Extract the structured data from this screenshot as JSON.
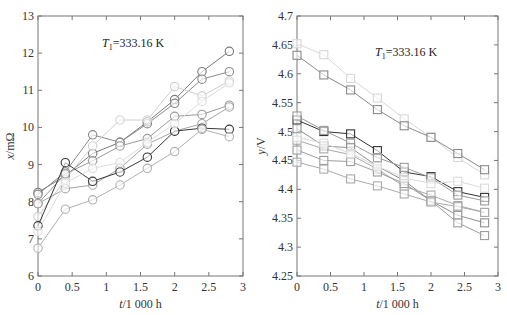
{
  "chart_data": [
    {
      "type": "line",
      "marker": "circle",
      "annotation": "T1=333.16 K",
      "annotation_main": "T",
      "annotation_sub": "1",
      "annotation_rest": "=333.16 K",
      "xlabel": "t/1 000 h",
      "ylabel": "x/mΩ",
      "xlim": [
        0,
        3
      ],
      "ylim": [
        6,
        13
      ],
      "xticks": [
        "0",
        "0.5",
        "1",
        "1.5",
        "2",
        "2.5",
        "3"
      ],
      "yticks": [
        "6",
        "7",
        "8",
        "9",
        "10",
        "11",
        "12",
        "13"
      ],
      "x": [
        0,
        0.4,
        0.8,
        1.2,
        1.6,
        2.0,
        2.4,
        2.8
      ],
      "series": [
        {
          "name": "s1",
          "color": "#7a7a7a",
          "values": [
            8.25,
            8.7,
            9.3,
            9.6,
            10.15,
            10.75,
            11.5,
            12.05
          ]
        },
        {
          "name": "s2",
          "color": "#8a8a8a",
          "values": [
            8.2,
            8.8,
            9.8,
            9.6,
            10.1,
            10.65,
            11.3,
            11.5
          ]
        },
        {
          "name": "s3",
          "color": "#cfcfcf",
          "values": [
            7.6,
            8.6,
            9.5,
            10.2,
            10.2,
            11.1,
            10.85,
            11.25
          ]
        },
        {
          "name": "s4",
          "color": "#9a9a9a",
          "values": [
            7.95,
            8.75,
            9.1,
            9.5,
            9.7,
            10.3,
            10.35,
            10.6
          ]
        },
        {
          "name": "s5",
          "color": "#a5a5a5",
          "values": [
            7.95,
            8.35,
            8.45,
            8.9,
            9.55,
            9.9,
            10.1,
            10.55
          ]
        },
        {
          "name": "s6",
          "color": "#3a3a3a",
          "values": [
            7.35,
            9.05,
            8.55,
            8.8,
            9.2,
            9.9,
            9.98,
            9.95
          ]
        },
        {
          "name": "s7",
          "color": "#b0b0b0",
          "values": [
            6.75,
            7.8,
            8.05,
            8.45,
            8.9,
            9.35,
            9.95,
            9.75
          ]
        },
        {
          "name": "s8",
          "color": "#dcdcdc",
          "values": [
            7.2,
            8.5,
            8.9,
            9.05,
            9.6,
            10.1,
            10.7,
            11.2
          ]
        }
      ]
    },
    {
      "type": "line",
      "marker": "square",
      "annotation": "T1=333.16 K",
      "annotation_main": "T",
      "annotation_sub": "1",
      "annotation_rest": "=333.16 K",
      "xlabel": "t/1 000 h",
      "ylabel": "y/V",
      "xlim": [
        0,
        3
      ],
      "ylim": [
        4.25,
        4.7
      ],
      "xticks": [
        "0",
        "0.5",
        "1",
        "1.5",
        "2",
        "2.5",
        "3"
      ],
      "yticks": [
        "4.25",
        "4.3",
        "4.35",
        "4.4",
        "4.45",
        "4.5",
        "4.55",
        "4.6",
        "4.65",
        "4.7"
      ],
      "x": [
        0,
        0.4,
        0.8,
        1.2,
        1.6,
        2.0,
        2.4,
        2.8
      ],
      "series": [
        {
          "name": "r1",
          "color": "#d8d8d8",
          "values": [
            4.652,
            4.633,
            4.592,
            4.558,
            4.522,
            4.49,
            4.455,
            4.425
          ]
        },
        {
          "name": "r2",
          "color": "#8a8a8a",
          "values": [
            4.632,
            4.598,
            4.572,
            4.538,
            4.51,
            4.49,
            4.462,
            4.434
          ]
        },
        {
          "name": "r3",
          "color": "#333333",
          "values": [
            4.52,
            4.5,
            4.496,
            4.467,
            4.43,
            4.422,
            4.396,
            4.386
          ]
        },
        {
          "name": "r4",
          "color": "#9a9a9a",
          "values": [
            4.527,
            4.502,
            4.48,
            4.455,
            4.438,
            4.42,
            4.39,
            4.38
          ]
        },
        {
          "name": "r5",
          "color": "#8f8f8f",
          "values": [
            4.505,
            4.475,
            4.472,
            4.44,
            4.415,
            4.38,
            4.355,
            4.342
          ]
        },
        {
          "name": "r6",
          "color": "#a8a8a8",
          "values": [
            4.485,
            4.47,
            4.46,
            4.435,
            4.405,
            4.39,
            4.372,
            4.36
          ]
        },
        {
          "name": "r7",
          "color": "#9c9c9c",
          "values": [
            4.468,
            4.45,
            4.448,
            4.43,
            4.41,
            4.38,
            4.342,
            4.32
          ]
        },
        {
          "name": "r8",
          "color": "#dadada",
          "values": [
            4.49,
            4.48,
            4.462,
            4.44,
            4.42,
            4.41,
            4.414,
            4.402
          ]
        },
        {
          "name": "r9",
          "color": "#aaaaaa",
          "values": [
            4.447,
            4.435,
            4.418,
            4.406,
            4.392,
            4.378,
            4.37,
            4.36
          ]
        }
      ]
    }
  ]
}
